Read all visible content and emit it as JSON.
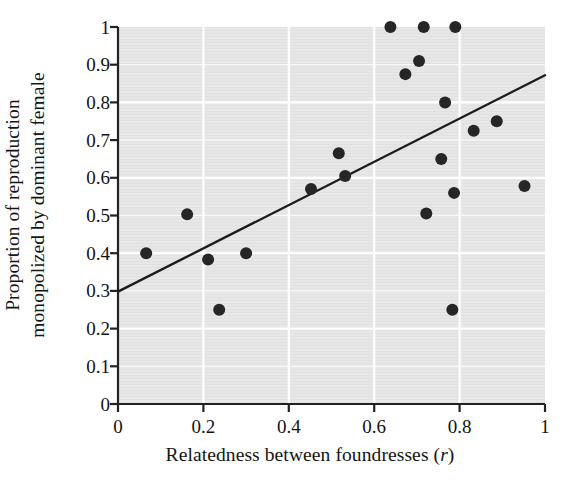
{
  "chart_data": {
    "type": "scatter",
    "title": "",
    "xlabel": "Relatedness between foundresses (r)",
    "xlabel_plain": "Relatedness between foundresses",
    "xlabel_italic_symbol": "r",
    "ylabel": "Proportion of reproduction monopolized by dominant female",
    "ylabel_line1": "Proportion of reproduction",
    "ylabel_line2": "monopolized by dominant female",
    "xlim": [
      0,
      1
    ],
    "ylim": [
      0,
      1
    ],
    "xticks": [
      0,
      0.2,
      0.4,
      0.6,
      0.8,
      1
    ],
    "xtick_labels": [
      "0",
      "0.2",
      "0.4",
      "0.6",
      "0.8",
      "1"
    ],
    "yticks": [
      0,
      0.1,
      0.2,
      0.3,
      0.4,
      0.5,
      0.6,
      0.7,
      0.8,
      0.9,
      1
    ],
    "ytick_labels": [
      "0",
      "0.1",
      "0.2",
      "0.3",
      "0.4",
      "0.5",
      "0.6",
      "0.7",
      "0.8",
      "0.9",
      "1"
    ],
    "grid": true,
    "grid_color": "#ffffff",
    "plot_background": "#e6e6e6",
    "marker_color": "#262626",
    "marker_size": 7,
    "legend": null,
    "points": [
      {
        "x": 0.066,
        "y": 0.4
      },
      {
        "x": 0.162,
        "y": 0.503
      },
      {
        "x": 0.211,
        "y": 0.383
      },
      {
        "x": 0.237,
        "y": 0.25
      },
      {
        "x": 0.3,
        "y": 0.4
      },
      {
        "x": 0.452,
        "y": 0.57
      },
      {
        "x": 0.517,
        "y": 0.665
      },
      {
        "x": 0.532,
        "y": 0.605
      },
      {
        "x": 0.638,
        "y": 1.0
      },
      {
        "x": 0.673,
        "y": 0.875
      },
      {
        "x": 0.705,
        "y": 0.91
      },
      {
        "x": 0.716,
        "y": 1.0
      },
      {
        "x": 0.722,
        "y": 0.505
      },
      {
        "x": 0.757,
        "y": 0.65
      },
      {
        "x": 0.766,
        "y": 0.8
      },
      {
        "x": 0.783,
        "y": 0.25
      },
      {
        "x": 0.787,
        "y": 0.56
      },
      {
        "x": 0.79,
        "y": 1.0
      },
      {
        "x": 0.833,
        "y": 0.725
      },
      {
        "x": 0.887,
        "y": 0.75
      },
      {
        "x": 0.952,
        "y": 0.578
      }
    ],
    "trendline": {
      "type": "line",
      "x0": 0.0,
      "y0": 0.298,
      "x1": 1.0,
      "y1": 0.872,
      "color": "#1c1c1c",
      "width": 2.4
    }
  }
}
